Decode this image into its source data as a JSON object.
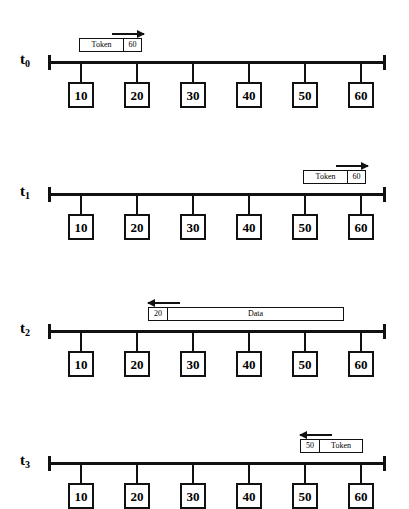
{
  "diagram": {
    "background_color": "#ffffff",
    "line_color": "#111111",
    "stations": [
      "10",
      "20",
      "30",
      "40",
      "50",
      "60"
    ],
    "rows": [
      {
        "time_label": "t",
        "time_sub": "0",
        "frame": {
          "cells": [
            "Token",
            "60"
          ],
          "direction": "right",
          "kind": "token"
        }
      },
      {
        "time_label": "t",
        "time_sub": "1",
        "frame": {
          "cells": [
            "Token",
            "60"
          ],
          "direction": "right",
          "kind": "token"
        }
      },
      {
        "time_label": "t",
        "time_sub": "2",
        "frame": {
          "cells": [
            "20",
            "Data"
          ],
          "direction": "left",
          "kind": "data"
        }
      },
      {
        "time_label": "t",
        "time_sub": "3",
        "frame": {
          "cells": [
            "50",
            "Token"
          ],
          "direction": "left",
          "kind": "token"
        }
      }
    ]
  }
}
